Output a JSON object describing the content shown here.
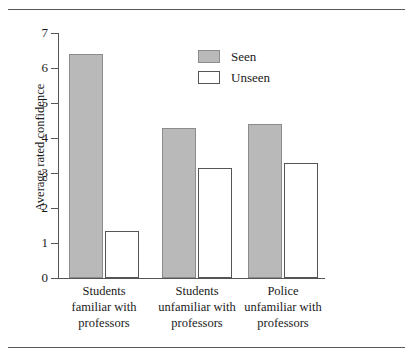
{
  "chart_data": {
    "type": "bar",
    "title": "",
    "xlabel": "",
    "ylabel": "Average rated confidence",
    "ylim": [
      0,
      7
    ],
    "ytick_labels": [
      "7",
      "6",
      "5",
      "4",
      "3",
      "2",
      "1",
      "0"
    ],
    "ytick_values": [
      7,
      6,
      5,
      4,
      3,
      2,
      1,
      0
    ],
    "grid": false,
    "legend_position": "upper center",
    "categories": [
      "Students familiar with professors",
      "Students unfamiliar with professors",
      "Police unfamiliar with professors"
    ],
    "category_lines": [
      [
        "Students",
        "familiar with",
        "professors"
      ],
      [
        "Students",
        "unfamiliar with",
        "professors"
      ],
      [
        "Police",
        "unfamiliar with",
        "professors"
      ]
    ],
    "series": [
      {
        "name": "Seen",
        "color": "#b9b9b9",
        "edge": "#8c8c8c",
        "values": [
          6.4,
          4.3,
          4.4
        ]
      },
      {
        "name": "Unseen",
        "color": "#ffffff",
        "edge": "#555555",
        "values": [
          1.35,
          3.15,
          3.3
        ]
      }
    ]
  },
  "axis": {
    "y_title": "Average rated confidence"
  },
  "legend": {
    "items": [
      {
        "label": "Seen"
      },
      {
        "label": "Unseen"
      }
    ]
  },
  "colors": {
    "seen_fill": "#b9b9b9",
    "seen_edge": "#8c8c8c",
    "unseen_fill": "#ffffff",
    "unseen_edge": "#555555",
    "axis": "#555555",
    "rule": "#585858",
    "text": "#1a1a1a"
  }
}
